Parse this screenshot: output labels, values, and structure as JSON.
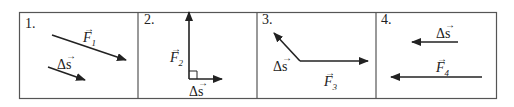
{
  "figure": {
    "panels": [
      {
        "number": "1.",
        "force_label": "F",
        "force_sub": "1",
        "disp_label": "Δs",
        "relation": "parallel, same direction"
      },
      {
        "number": "2.",
        "force_label": "F",
        "force_sub": "2",
        "disp_label": "Δs",
        "relation": "perpendicular"
      },
      {
        "number": "3.",
        "force_label": "F",
        "force_sub": "3",
        "disp_label": "Δs",
        "relation": "obtuse angle"
      },
      {
        "number": "4.",
        "force_label": "F",
        "force_sub": "4",
        "disp_label": "Δs",
        "relation": "parallel, same direction (leftward)"
      }
    ],
    "vector_arrow": "→",
    "colors": {
      "line": "#222222",
      "border": "#555555",
      "background": "#ffffff"
    }
  }
}
